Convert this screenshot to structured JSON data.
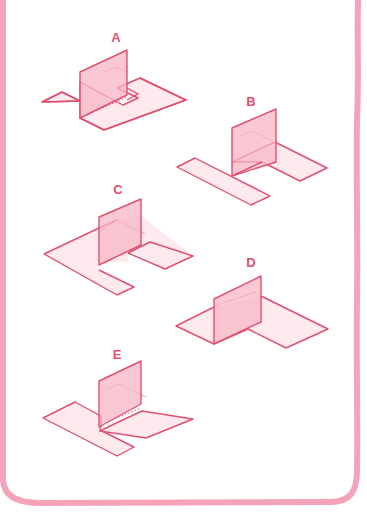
{
  "colors": {
    "line": "#e0506e",
    "panel_fill": "#f7b6c6",
    "border": "#f4a3b8",
    "background": "#ffffff"
  },
  "figures": [
    {
      "id": "A",
      "label": "A",
      "label_pos": [
        116,
        37
      ]
    },
    {
      "id": "B",
      "label": "B",
      "label_pos": [
        251,
        101
      ]
    },
    {
      "id": "C",
      "label": "C",
      "label_pos": [
        118,
        189
      ]
    },
    {
      "id": "D",
      "label": "D",
      "label_pos": [
        251,
        262
      ]
    },
    {
      "id": "E",
      "label": "E",
      "label_pos": [
        117,
        354
      ]
    }
  ]
}
